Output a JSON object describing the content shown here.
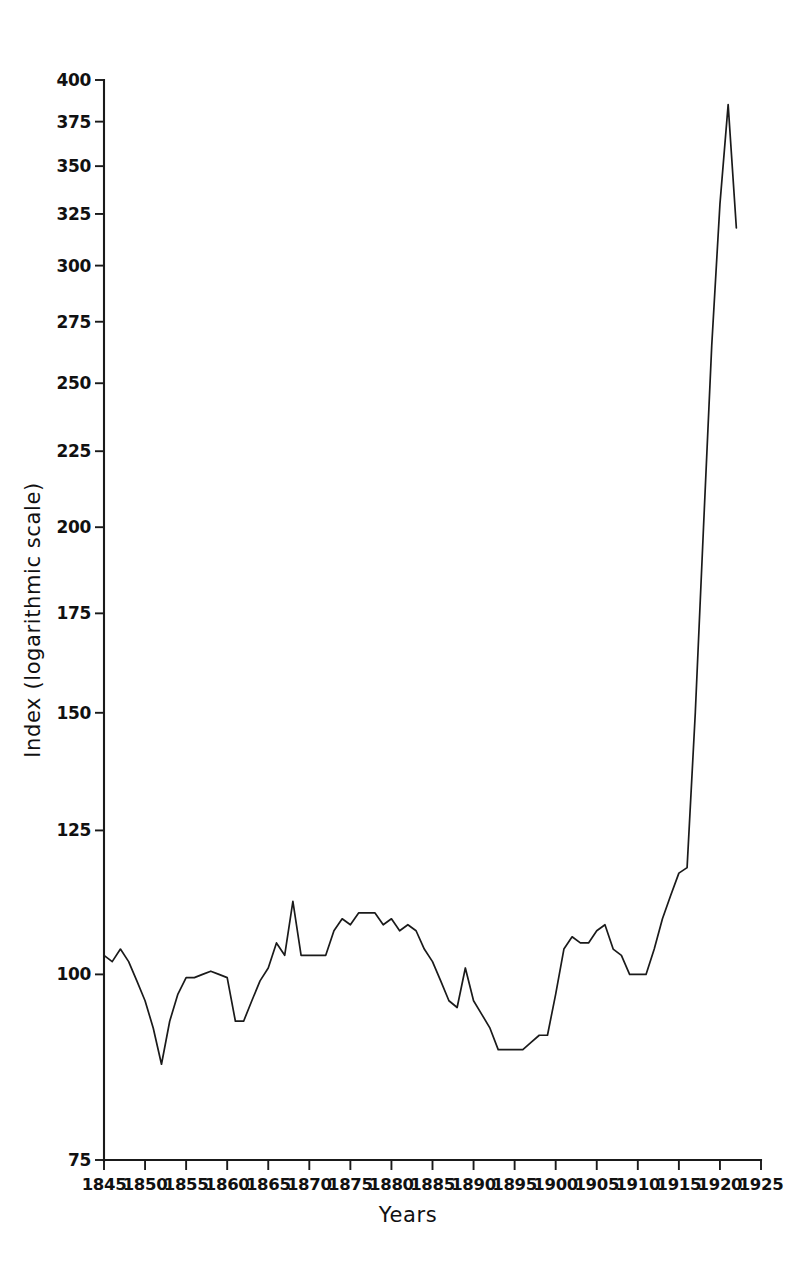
{
  "chart_data": {
    "type": "line",
    "title": "",
    "xlabel": "Years",
    "ylabel": "Index (logarithmic scale)",
    "yscale": "log",
    "xlim": [
      1845,
      1925
    ],
    "ylim": [
      75,
      400
    ],
    "grid": false,
    "legend": "none",
    "y_ticks": [
      75,
      100,
      125,
      150,
      175,
      200,
      225,
      250,
      275,
      300,
      325,
      350,
      375,
      400
    ],
    "y_tick_labels": [
      "75",
      "100",
      "125",
      "150",
      "175",
      "200",
      "225",
      "250",
      "275",
      "300",
      "325",
      "350",
      "375",
      "400"
    ],
    "x_ticks": [
      1845,
      1850,
      1855,
      1860,
      1865,
      1870,
      1875,
      1880,
      1885,
      1890,
      1895,
      1900,
      1905,
      1910,
      1915,
      1920,
      1925
    ],
    "x_tick_labels": [
      "1845",
      "1850",
      "1855",
      "1860",
      "1865",
      "1870",
      "1875",
      "1880",
      "1885",
      "1890",
      "1895",
      "1900",
      "1905",
      "1910",
      "1915",
      "1920",
      "1925"
    ],
    "series": [
      {
        "name": "Index",
        "color": "#1a1a1a",
        "x": [
          1845,
          1846,
          1847,
          1848,
          1849,
          1850,
          1851,
          1852,
          1853,
          1854,
          1855,
          1856,
          1857,
          1858,
          1859,
          1860,
          1861,
          1862,
          1863,
          1864,
          1865,
          1866,
          1867,
          1868,
          1869,
          1870,
          1871,
          1872,
          1873,
          1874,
          1875,
          1876,
          1877,
          1878,
          1879,
          1880,
          1881,
          1882,
          1883,
          1884,
          1885,
          1886,
          1887,
          1888,
          1889,
          1890,
          1891,
          1892,
          1893,
          1894,
          1895,
          1896,
          1897,
          1898,
          1899,
          1900,
          1901,
          1902,
          1903,
          1904,
          1905,
          1906,
          1907,
          1908,
          1909,
          1910,
          1911,
          1912,
          1913,
          1914,
          1915,
          1916,
          1917,
          1918,
          1919,
          1920,
          1921,
          1922
        ],
        "values": [
          103,
          102,
          104,
          102,
          99,
          96,
          92,
          87,
          93,
          97,
          99.5,
          99.5,
          100,
          100.5,
          100,
          99.5,
          93,
          93,
          96,
          99,
          101,
          105,
          103,
          112,
          103,
          103,
          103,
          103,
          107,
          109,
          108,
          110,
          110,
          110,
          108,
          109,
          107,
          108,
          107,
          104,
          102,
          99,
          96,
          95,
          101,
          96,
          94,
          92,
          89,
          89,
          89,
          89,
          90,
          91,
          91,
          97,
          104,
          106,
          105,
          105,
          107,
          108,
          104,
          103,
          100,
          100,
          100,
          104,
          109,
          113,
          117,
          118,
          150,
          200,
          265,
          330,
          385,
          318
        ]
      }
    ]
  },
  "axis": {
    "x_title": "Years",
    "y_title": "Index (logarithmic scale)"
  }
}
